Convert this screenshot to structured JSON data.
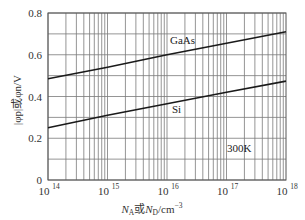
{
  "chart_data": {
    "type": "line",
    "title": "",
    "xlabel": "N_A或N_D/cm^-3",
    "ylabel": "|φ_p|或φ_n/V",
    "xscale": "log",
    "xlim": [
      100000000000000.0,
      1e+18
    ],
    "ylim": [
      0,
      0.8
    ],
    "grid": true,
    "x_ticks": [
      {
        "base": "10",
        "exp": "14",
        "value": 100000000000000.0
      },
      {
        "base": "10",
        "exp": "15",
        "value": 1000000000000000.0
      },
      {
        "base": "10",
        "exp": "16",
        "value": 1e+16
      },
      {
        "base": "10",
        "exp": "17",
        "value": 1e+17
      },
      {
        "base": "10",
        "exp": "18",
        "value": 1e+18
      }
    ],
    "y_ticks": [
      "0",
      "0.2",
      "0.4",
      "0.6",
      "0.8"
    ],
    "y_tick_values": [
      0,
      0.2,
      0.4,
      0.6,
      0.8
    ],
    "series": [
      {
        "name": "GaAs",
        "x": [
          100000000000000.0,
          1000000000000000.0,
          1e+16,
          1e+17,
          1e+18
        ],
        "values": [
          0.485,
          0.54,
          0.6,
          0.655,
          0.71
        ]
      },
      {
        "name": "Si",
        "x": [
          100000000000000.0,
          1000000000000000.0,
          1e+16,
          1e+17,
          1e+18
        ],
        "values": [
          0.25,
          0.31,
          0.365,
          0.42,
          0.474
        ]
      }
    ],
    "annotations": [
      {
        "text": "GaAs",
        "x": 3e+16,
        "y": 0.67
      },
      {
        "text": "Si",
        "x": 3e+16,
        "y": 0.34
      },
      {
        "text": "300K",
        "x": 2e+17,
        "y": 0.15
      }
    ],
    "legend": "none"
  },
  "labels": {
    "xlabel_main1": "N",
    "xlabel_sub1": "A",
    "xlabel_mid": "或",
    "xlabel_main2": "N",
    "xlabel_sub2": "D",
    "xlabel_unit": "/cm",
    "xlabel_exp": "−3",
    "ylabel": "|φp|或φn/V",
    "gaas": "GaAs",
    "si": "Si",
    "temperature": "300K"
  }
}
